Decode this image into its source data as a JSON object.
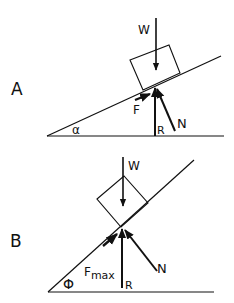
{
  "diagrams": [
    {
      "id": "A",
      "panel_label": "A",
      "angle_label": "α",
      "force_labels": {
        "weight": "W",
        "friction": "F",
        "reaction": "R",
        "normal": "N"
      }
    },
    {
      "id": "B",
      "panel_label": "B",
      "angle_label": "Φ",
      "force_labels": {
        "weight": "W",
        "friction": "F",
        "friction_sub": "max",
        "reaction": "R",
        "normal": "N"
      }
    }
  ],
  "colors": {
    "ink": "#111111",
    "background": "#ffffff"
  }
}
